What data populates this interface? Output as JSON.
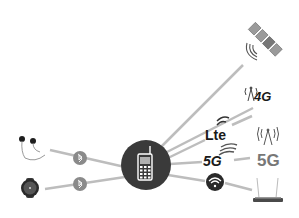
{
  "diagram": {
    "center": {
      "name": "mobile-phone",
      "icon": "phone-icon",
      "color": "#3a3a3a"
    },
    "line_color": "#bdbdbd",
    "nodes": [
      {
        "id": "satellite",
        "icon": "satellite-icon",
        "label": ""
      },
      {
        "id": "4g-tower",
        "icon": "cell-tower-icon",
        "label": "4G"
      },
      {
        "id": "lte",
        "icon": "lte-icon",
        "label": "Lte"
      },
      {
        "id": "5g",
        "icon": "5g-icon",
        "label": "5G"
      },
      {
        "id": "5g-tower",
        "icon": "cell-tower-icon",
        "label": "5G"
      },
      {
        "id": "wifi",
        "icon": "wifi-icon",
        "label": ""
      },
      {
        "id": "router",
        "icon": "router-icon",
        "label": ""
      },
      {
        "id": "earphones",
        "icon": "earphones-icon",
        "label": ""
      },
      {
        "id": "smartwatch",
        "icon": "smartwatch-icon",
        "label": ""
      },
      {
        "id": "bluetooth-1",
        "icon": "bluetooth-icon",
        "label": ""
      },
      {
        "id": "bluetooth-2",
        "icon": "bluetooth-icon",
        "label": ""
      }
    ],
    "labels": {
      "four_g": "4G",
      "lte": "Lte",
      "five_g": "5G",
      "five_g_tower": "5G"
    }
  }
}
